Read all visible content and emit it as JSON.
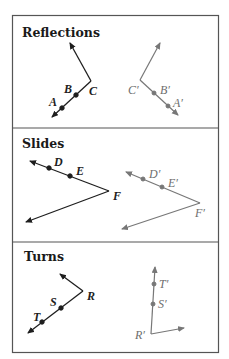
{
  "panels": [
    {
      "title": "Reflections",
      "original_labels": [
        "A",
        "B",
        "C"
      ],
      "image_labels": [
        "A′",
        "B′",
        "C′"
      ]
    },
    {
      "title": "Slides",
      "original_labels": [
        "D",
        "E",
        "F"
      ],
      "image_labels": [
        "D′",
        "E′",
        "F′"
      ]
    },
    {
      "title": "Turns",
      "original_labels": [
        "T",
        "S",
        "R"
      ],
      "image_labels": [
        "T′",
        "S′",
        "R′"
      ]
    }
  ],
  "colors": {
    "original": "#1e1e1e",
    "image": "#777777",
    "frame": "#555555"
  }
}
